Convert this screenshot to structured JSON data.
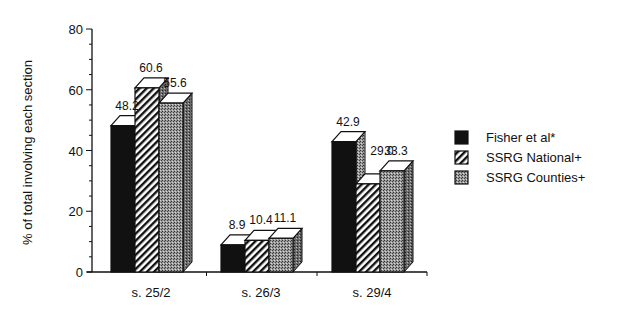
{
  "chart_data": {
    "type": "bar",
    "style": "3d-grouped",
    "title": "",
    "xlabel": "",
    "ylabel": "% of total involving each section",
    "ylim": [
      0,
      80
    ],
    "yticks": [
      0,
      20,
      40,
      60,
      80
    ],
    "grid": false,
    "legend_position": "right",
    "categories": [
      "s.  25/2",
      "s.  26/3",
      "s.  29/4"
    ],
    "series": [
      {
        "name": "Fisher et al*",
        "pattern": "solid-black",
        "values": [
          48.2,
          8.9,
          42.9
        ],
        "labels": [
          "48.2",
          "8.9",
          "42.9"
        ]
      },
      {
        "name": "SSRG National+",
        "pattern": "diagonal-hatch",
        "values": [
          60.6,
          10.4,
          29.0
        ],
        "labels": [
          "60.6",
          "10.4",
          "29.0"
        ]
      },
      {
        "name": "SSRG Counties+",
        "pattern": "stipple-gray",
        "values": [
          55.6,
          11.1,
          33.3
        ],
        "labels": [
          "55.6",
          "11.1",
          "33.3"
        ]
      }
    ]
  },
  "colors": {
    "ink": "#111111",
    "background": "#ffffff",
    "stipple": "#8a8a8a",
    "top_face": "#ffffff"
  }
}
